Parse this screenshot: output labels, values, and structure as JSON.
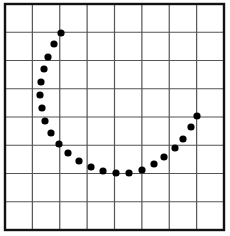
{
  "figure": {
    "grid": {
      "columns": 8,
      "rows": 8,
      "left": 5,
      "top": 4,
      "right": 224,
      "bottom": 230,
      "line_color": "#555555",
      "border_color": "#111111"
    },
    "dot_color": "#000000",
    "dot_radius": 3.6,
    "dots": [
      {
        "x": 61,
        "y": 33
      },
      {
        "x": 54,
        "y": 44
      },
      {
        "x": 48,
        "y": 57
      },
      {
        "x": 44,
        "y": 69
      },
      {
        "x": 41,
        "y": 82
      },
      {
        "x": 40,
        "y": 95
      },
      {
        "x": 42,
        "y": 108
      },
      {
        "x": 45,
        "y": 121
      },
      {
        "x": 51,
        "y": 133
      },
      {
        "x": 59,
        "y": 144
      },
      {
        "x": 68,
        "y": 153
      },
      {
        "x": 79,
        "y": 161
      },
      {
        "x": 91,
        "y": 167
      },
      {
        "x": 103,
        "y": 171
      },
      {
        "x": 116,
        "y": 173
      },
      {
        "x": 129,
        "y": 173
      },
      {
        "x": 142,
        "y": 170
      },
      {
        "x": 154,
        "y": 164
      },
      {
        "x": 164,
        "y": 157
      },
      {
        "x": 175,
        "y": 148
      },
      {
        "x": 183,
        "y": 139
      },
      {
        "x": 191,
        "y": 127
      },
      {
        "x": 197,
        "y": 116
      }
    ]
  }
}
